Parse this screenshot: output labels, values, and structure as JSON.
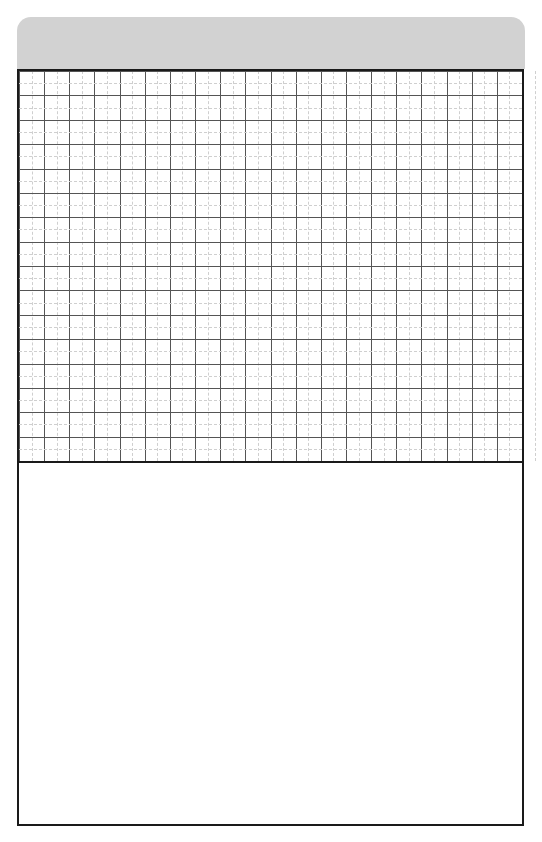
{
  "page": {
    "background_color": "#ffffff",
    "width": 542,
    "height": 842
  },
  "header_tab": {
    "name": "header-tab",
    "label": "",
    "fill_color": "#d2d2d2",
    "corner_radius": "14px",
    "is_blank": true
  },
  "document_frame": {
    "border_color": "#1a1a1a",
    "border_width": "2px",
    "fill_color": "#ffffff"
  },
  "grid": {
    "name": "graph-grid",
    "major_columns": 20,
    "major_rows": 16,
    "minor_subdivisions": 2,
    "major_line_color": "#555555",
    "minor_line_color": "#cfcfcf",
    "minor_line_style": "dashed",
    "cell_width_px": 25.15,
    "cell_height_px": 24.5,
    "is_empty": true,
    "content": ""
  },
  "blank_area": {
    "name": "blank-writing-area",
    "fill_color": "#ffffff",
    "is_empty": true,
    "content": ""
  }
}
